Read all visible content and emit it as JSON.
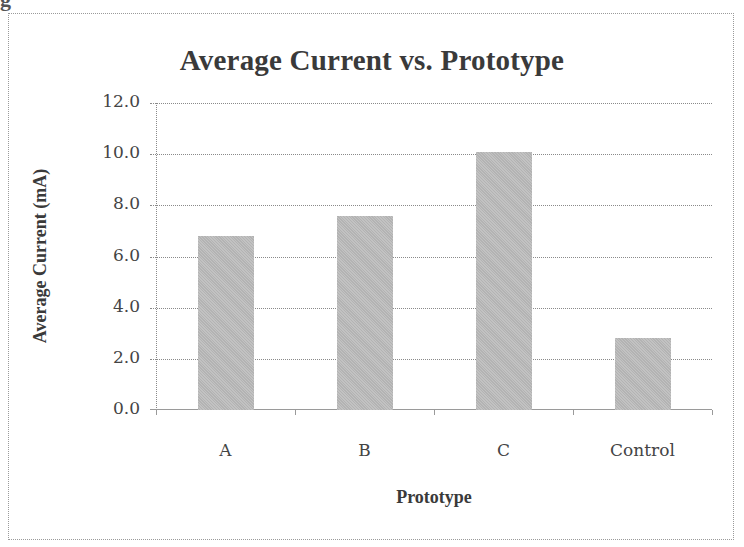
{
  "chart_data": {
    "type": "bar",
    "title": "Average Current vs. Prototype",
    "xlabel": "Prototype",
    "ylabel": "Average Current (mA)",
    "categories": [
      "A",
      "B",
      "C",
      "Control"
    ],
    "values": [
      6.8,
      7.6,
      10.1,
      2.8
    ],
    "ylim": [
      0,
      12
    ],
    "yticks": [
      "0.0",
      "2.0",
      "4.0",
      "6.0",
      "8.0",
      "10.0",
      "12.0"
    ],
    "grid": true,
    "legend": null,
    "bar_color": "#bcbcbc"
  }
}
